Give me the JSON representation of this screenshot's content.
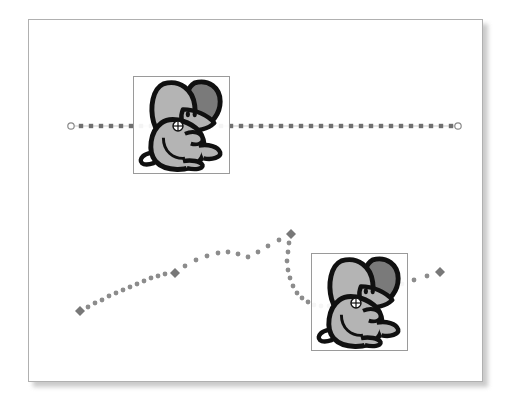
{
  "canvas": {
    "label": "motion-path-stage",
    "background_color": "#ffffff",
    "border_color": "#b0b0b0",
    "shadow_color": "#b9b9b9",
    "x": 28,
    "y": 19,
    "width": 455,
    "height": 363
  },
  "sprites": [
    {
      "id": "mouse-sprite-top",
      "label": "Mouse",
      "box": {
        "x": 133,
        "y": 76,
        "width": 97,
        "height": 98
      },
      "border_color": "#9a9a9a",
      "registration_point": {
        "x": 178,
        "y": 126
      },
      "colors": {
        "outline": "#101010",
        "body": "#b4b4b4",
        "ear_front": "#b4b4b4",
        "ear_back": "#7a7a7a",
        "highlight": "#ffffff"
      }
    },
    {
      "id": "mouse-sprite-bottom",
      "label": "Mouse",
      "box": {
        "x": 311,
        "y": 253,
        "width": 97,
        "height": 98
      },
      "border_color": "#9a9a9a",
      "registration_point": {
        "x": 356,
        "y": 303
      },
      "colors": {
        "outline": "#101010",
        "body": "#b4b4b4",
        "ear_front": "#b4b4b4",
        "ear_back": "#7a7a7a",
        "highlight": "#ffffff"
      }
    }
  ],
  "chart_data": {
    "type": "scatter",
    "title": "",
    "subtitle": "",
    "xlabel": "",
    "ylabel": "",
    "grid": false,
    "legend": "none",
    "xlim": [
      28,
      483
    ],
    "ylim": [
      19,
      382
    ],
    "series": [
      {
        "name": "linear-motion-path",
        "style": "dotted-straight",
        "dot_color": "#6f6f6f",
        "line_color": "#c9c9c9",
        "dot_shape": "square",
        "dot_size": 2.2,
        "dot_spacing": 10,
        "endpoint_shape": "circle",
        "endpoint_color": "#8a8a8a",
        "endpoints": [
          {
            "x": 71,
            "y": 126
          },
          {
            "x": 458,
            "y": 126
          }
        ],
        "x": [
          71,
          81,
          91,
          101,
          111,
          121,
          131,
          141,
          151,
          161,
          171,
          181,
          191,
          201,
          211,
          221,
          231,
          241,
          251,
          261,
          271,
          281,
          291,
          301,
          311,
          321,
          331,
          341,
          351,
          361,
          371,
          381,
          391,
          401,
          411,
          421,
          431,
          441,
          451,
          458
        ],
        "y": [
          126,
          126,
          126,
          126,
          126,
          126,
          126,
          126,
          126,
          126,
          126,
          126,
          126,
          126,
          126,
          126,
          126,
          126,
          126,
          126,
          126,
          126,
          126,
          126,
          126,
          126,
          126,
          126,
          126,
          126,
          126,
          126,
          126,
          126,
          126,
          126,
          126,
          126,
          126,
          126
        ]
      },
      {
        "name": "curved-motion-path",
        "style": "dotted-curve",
        "dot_color": "#8c8c8c",
        "dot_shape": "circle",
        "dot_size": 2.4,
        "keyframe_shape": "diamond",
        "keyframe_color": "#787878",
        "keyframe_size": 5,
        "keyframes": [
          {
            "x": 80,
            "y": 311
          },
          {
            "x": 175,
            "y": 273
          },
          {
            "x": 291,
            "y": 234
          },
          {
            "x": 440,
            "y": 272
          }
        ],
        "x": [
          80,
          88,
          95,
          102,
          109,
          116,
          123,
          130,
          137,
          144,
          151,
          158,
          165,
          175,
          185,
          196,
          207,
          218,
          228,
          238,
          248,
          258,
          268,
          279,
          291,
          289,
          288,
          287,
          288,
          290,
          293,
          297,
          302,
          308,
          314,
          321,
          329,
          338,
          347,
          357,
          368,
          379,
          390,
          402,
          414,
          427,
          440
        ],
        "y": [
          311,
          307,
          303,
          300,
          296,
          293,
          290,
          287,
          284,
          281,
          278,
          276,
          274,
          273,
          266,
          260,
          256,
          253,
          252,
          254,
          257,
          252,
          246,
          240,
          234,
          243,
          252,
          261,
          270,
          278,
          286,
          293,
          298,
          302,
          305,
          306,
          306,
          305,
          303,
          300,
          296,
          292,
          288,
          284,
          280,
          276,
          272
        ]
      }
    ]
  },
  "markers": {
    "registration_icon": "crosshair-circle-icon",
    "endpoint_icon": "circle-handle-icon",
    "keyframe_icon": "diamond-keyframe-icon",
    "tween_icon": "tween-dot-icon"
  }
}
